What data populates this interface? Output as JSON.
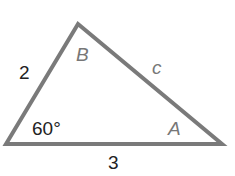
{
  "diagram": {
    "type": "triangle",
    "vertices": {
      "A": "bottom-right",
      "B": "top",
      "C": "bottom-left"
    },
    "side_left": "2",
    "side_bottom": "3",
    "side_right": "c",
    "angle_bottom_left": "60°",
    "vertex_label_top": "B",
    "vertex_label_right": "A",
    "stroke_color": "#7a7a7a"
  }
}
